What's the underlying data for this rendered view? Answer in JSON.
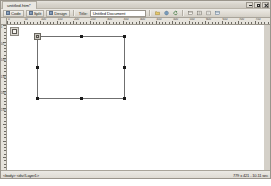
{
  "window": {
    "document_tab": "untitled.htm*",
    "controls": {
      "minimize": "Minimize",
      "maximize": "Maximize",
      "close": "Close"
    }
  },
  "toolbar": {
    "view_buttons": [
      {
        "label": "Code",
        "icon": "code-view-icon"
      },
      {
        "label": "Split",
        "icon": "split-view-icon"
      },
      {
        "label": "Design",
        "icon": "design-view-icon"
      }
    ],
    "title_label": "Title:",
    "title_value": "Untitled Document",
    "title_placeholder": "Untitled Document",
    "right_icons": [
      {
        "name": "file-management-icon"
      },
      {
        "name": "preview-in-browser-icon"
      },
      {
        "name": "refresh-design-view-icon"
      },
      {
        "name": "view-options-icon"
      },
      {
        "name": "visual-aids-icon"
      },
      {
        "name": "validate-markup-icon"
      },
      {
        "name": "check-browser-support-icon"
      }
    ]
  },
  "rulers": {
    "horizontal_unit": "pixels",
    "horizontal_ticks": [
      "0",
      "50",
      "100",
      "150",
      "200",
      "250",
      "300",
      "350",
      "400",
      "450",
      "500",
      "550",
      "600",
      "650",
      "700",
      "750"
    ],
    "vertical_ticks": [
      "0",
      "50",
      "100",
      "150",
      "200",
      "250"
    ]
  },
  "canvas": {
    "layer_marker_icon": "layer-marker-icon",
    "selected_layer": {
      "name": "Layer1",
      "selected": true,
      "handles": [
        "nw",
        "n",
        "ne",
        "w",
        "e",
        "sw",
        "s",
        "se"
      ],
      "drag_handle": "layer-drag-handle"
    }
  },
  "statusbar": {
    "tag_selector": "<body> <div#Layer1>",
    "doc_size": "779 x 421 - 10.11 sec"
  }
}
